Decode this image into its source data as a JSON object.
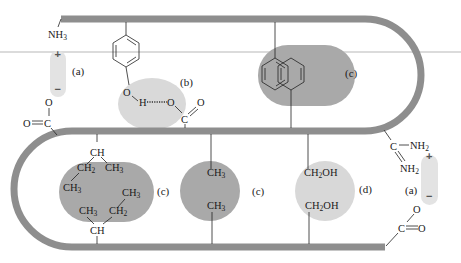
{
  "diagram": {
    "colors": {
      "backbone": "#8e8e8e",
      "hydrophobic_blob": "#a8a8a8",
      "polar_blob": "#d6d6d6",
      "salt_bridge_pill": "#e2e2e2",
      "ruler_line": "#c8c8c8",
      "bond": "#222222"
    },
    "labels": {
      "a1": "(a)",
      "b": "(b)",
      "c1": "(c)",
      "c2": "(c)",
      "c3": "(c)",
      "d": "(d)",
      "a2": "(a)"
    },
    "groups": {
      "nh3": "NH",
      "nh3_sub": "3",
      "plus": "+",
      "minus": "−",
      "o": "O",
      "c": "C",
      "h": "H",
      "ch": "CH",
      "ch2": "CH",
      "ch2_sub": "2",
      "ch3": "CH",
      "ch3_sub": "3",
      "ch2oh_a": "CH",
      "ch2oh_sub": "2",
      "ch2oh_b": "OH",
      "nh2": "NH",
      "nh2_sub": "2"
    },
    "interactions": [
      {
        "label": "(a)",
        "type": "salt bridge (NH3+ / COO-)"
      },
      {
        "label": "(b)",
        "type": "hydrogen bond (tyrosine OH ··· carbonyl O)"
      },
      {
        "label": "(c)",
        "type": "hydrophobic interaction (phenyl rings)"
      },
      {
        "label": "(c)",
        "type": "hydrophobic interaction (isoleucine side chains)"
      },
      {
        "label": "(c)",
        "type": "hydrophobic interaction (CH3 / CH3)"
      },
      {
        "label": "(d)",
        "type": "hydrogen bond / polar (CH2OH / CH2OH)"
      },
      {
        "label": "(a)",
        "type": "salt bridge (guanidinium / COO-)"
      }
    ]
  }
}
